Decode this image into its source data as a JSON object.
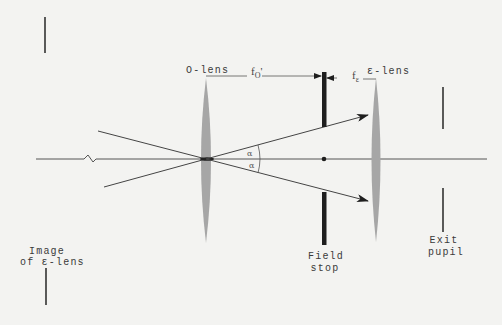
{
  "diagram": {
    "title": "",
    "colors": {
      "background": "#f3f3f1",
      "lens_fill": "#a6a6a6",
      "stop": "#1e1e1e",
      "line": "#4a4a4a"
    },
    "optical_axis": {
      "y": 159,
      "x_start": 36,
      "x_end": 487,
      "break_symbol": "zigzag"
    },
    "elements": [
      {
        "id": "o-lens",
        "type": "lens",
        "label": "O-lens",
        "x": 206,
        "y_top": 78,
        "y_bottom": 243
      },
      {
        "id": "field-stop",
        "type": "stop",
        "label_line1": "Field",
        "label_line2": "stop",
        "x": 324,
        "aperture_top": 127,
        "aperture_bottom": 192
      },
      {
        "id": "e-lens",
        "type": "lens",
        "label": "ε-lens",
        "x": 376,
        "y_top": 78,
        "y_bottom": 242
      },
      {
        "id": "exit-pupil",
        "type": "pupil",
        "label_line1": "Exit",
        "label_line2": "pupil",
        "x": 443
      },
      {
        "id": "image-of-e-lens",
        "type": "pupil-image",
        "label_line1": "Image",
        "label_line2": "of ε-lens",
        "x": 45
      }
    ],
    "dimensions": {
      "f_o_prime": {
        "symbol": "f",
        "subscript": "O",
        "prime": "'"
      },
      "f_e": {
        "symbol": "f",
        "subscript": "ε"
      }
    },
    "angles": {
      "upper": "α",
      "lower": "α"
    },
    "labels": {
      "o_lens": "O-lens",
      "e_lens": "ε-lens",
      "field_stop_1": "Field",
      "field_stop_2": "stop",
      "exit_pupil_1": "Exit",
      "exit_pupil_2": "pupil",
      "image_1": "Image",
      "image_2": "of ε-lens",
      "f_main": "f",
      "f_o_sub": "O",
      "f_o_prime": "'",
      "f_e_sub": "ε",
      "alpha_upper": "α",
      "alpha_lower": "α"
    }
  }
}
